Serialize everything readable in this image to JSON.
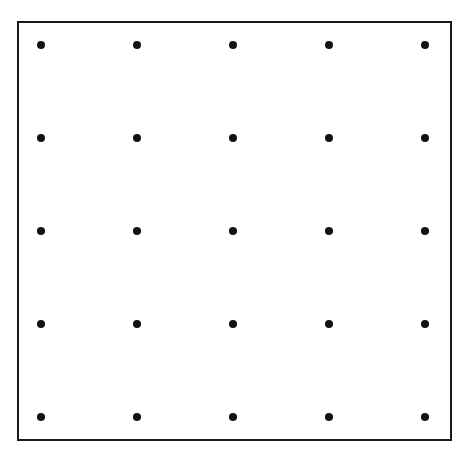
{
  "diagram": {
    "type": "dot-grid",
    "rows": 5,
    "columns": 5,
    "colors": {
      "dot": "#111111",
      "border": "#1a1a1a",
      "background": "#ffffff"
    },
    "column_x": [
      41,
      137,
      233,
      329,
      425
    ],
    "row_y": [
      45,
      138,
      231,
      324,
      417
    ],
    "dot_diameter": 8
  }
}
